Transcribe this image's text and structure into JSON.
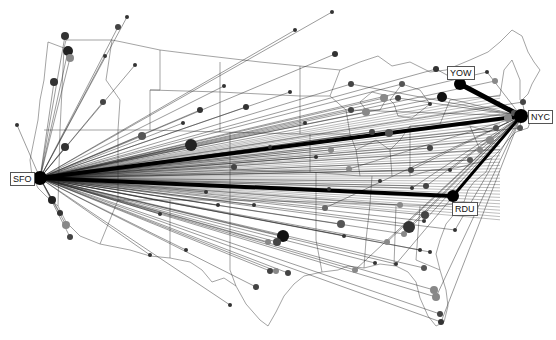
{
  "hubs": [
    {
      "code": "SFO",
      "x": 40,
      "y": 178,
      "label_x": 10,
      "label_y": 177
    },
    {
      "code": "NYC",
      "x": 521,
      "y": 116,
      "label_x": 529,
      "label_y": 111
    },
    {
      "code": "YOW",
      "x": 460,
      "y": 84,
      "label_x": 447,
      "label_y": 66
    },
    {
      "code": "RDU",
      "x": 453,
      "y": 196,
      "label_x": 453,
      "label_y": 202
    }
  ],
  "heavy_routes": [
    {
      "from": "SFO",
      "to": "NYC",
      "width": 4
    },
    {
      "from": "SFO",
      "to": "RDU",
      "width": 4
    },
    {
      "from": "YOW",
      "to": "NYC",
      "width": 5
    },
    {
      "from": "RDU",
      "to": "NYC",
      "width": 3
    }
  ],
  "colors": {
    "route": "#222222",
    "border": "#555555",
    "node_dark": "#111111",
    "node_mid": "#555555",
    "node_light": "#888888"
  },
  "nodes": [
    [
      127,
      17,
      2,
      "#333"
    ],
    [
      118,
      27,
      3,
      "#444"
    ],
    [
      65,
      36,
      4,
      "#333"
    ],
    [
      68,
      51,
      5,
      "#222"
    ],
    [
      70,
      58,
      4,
      "#888"
    ],
    [
      105,
      56,
      2,
      "#333"
    ],
    [
      135,
      65,
      2,
      "#333"
    ],
    [
      54,
      82,
      4,
      "#333"
    ],
    [
      17,
      125,
      2,
      "#333"
    ],
    [
      103,
      102,
      3,
      "#444"
    ],
    [
      142,
      136,
      4,
      "#555"
    ],
    [
      191,
      145,
      6,
      "#222"
    ],
    [
      65,
      147,
      4,
      "#333"
    ],
    [
      60,
      213,
      3,
      "#333"
    ],
    [
      66,
      225,
      4,
      "#888"
    ],
    [
      70,
      237,
      3,
      "#444"
    ],
    [
      52,
      200,
      4,
      "#222"
    ],
    [
      283,
      236,
      6,
      "#111"
    ],
    [
      277,
      242,
      4,
      "#444"
    ],
    [
      268,
      242,
      3,
      "#888"
    ],
    [
      270,
      271,
      3,
      "#444"
    ],
    [
      276,
      271,
      3,
      "#888"
    ],
    [
      288,
      273,
      3,
      "#444"
    ],
    [
      256,
      287,
      3,
      "#444"
    ],
    [
      325,
      208,
      3,
      "#666"
    ],
    [
      344,
      236,
      2,
      "#333"
    ],
    [
      387,
      242,
      3,
      "#888"
    ],
    [
      375,
      263,
      2,
      "#333"
    ],
    [
      355,
      270,
      3,
      "#888"
    ],
    [
      424,
      268,
      3,
      "#555"
    ],
    [
      396,
      264,
      2,
      "#333"
    ],
    [
      341,
      224,
      4,
      "#555"
    ],
    [
      409,
      227,
      6,
      "#333"
    ],
    [
      425,
      215,
      4,
      "#444"
    ],
    [
      424,
      221,
      2,
      "#333"
    ],
    [
      430,
      252,
      2,
      "#333"
    ],
    [
      455,
      230,
      2,
      "#333"
    ],
    [
      434,
      290,
      4,
      "#888"
    ],
    [
      436,
      297,
      4,
      "#888"
    ],
    [
      440,
      314,
      3,
      "#444"
    ],
    [
      441,
      322,
      3,
      "#333"
    ],
    [
      366,
      112,
      4,
      "#888"
    ],
    [
      351,
      110,
      3,
      "#444"
    ],
    [
      384,
      98,
      4,
      "#888"
    ],
    [
      398,
      98,
      3,
      "#444"
    ],
    [
      430,
      104,
      2,
      "#333"
    ],
    [
      442,
      97,
      5,
      "#111"
    ],
    [
      372,
      132,
      3,
      "#444"
    ],
    [
      389,
      133,
      4,
      "#555"
    ],
    [
      331,
      150,
      3,
      "#888"
    ],
    [
      246,
      107,
      3,
      "#333"
    ],
    [
      305,
      123,
      2,
      "#333"
    ],
    [
      426,
      186,
      3,
      "#444"
    ],
    [
      430,
      148,
      3,
      "#444"
    ],
    [
      450,
      170,
      2,
      "#333"
    ],
    [
      470,
      160,
      3,
      "#555"
    ],
    [
      480,
      150,
      3,
      "#888"
    ],
    [
      490,
      140,
      4,
      "#888"
    ],
    [
      496,
      128,
      3,
      "#555"
    ],
    [
      508,
      118,
      4,
      "#888"
    ],
    [
      514,
      113,
      3,
      "#555"
    ],
    [
      332,
      12,
      2,
      "#333"
    ],
    [
      295,
      30,
      2,
      "#333"
    ],
    [
      290,
      92,
      2,
      "#333"
    ],
    [
      224,
      86,
      2,
      "#333"
    ],
    [
      200,
      110,
      3,
      "#333"
    ],
    [
      183,
      123,
      2,
      "#333"
    ],
    [
      335,
      54,
      3,
      "#333"
    ],
    [
      351,
      84,
      3,
      "#444"
    ],
    [
      402,
      84,
      3,
      "#555"
    ],
    [
      436,
      69,
      3,
      "#333"
    ],
    [
      495,
      81,
      3,
      "#888"
    ],
    [
      487,
      72,
      2,
      "#333"
    ],
    [
      523,
      102,
      3,
      "#444"
    ],
    [
      520,
      128,
      3,
      "#555"
    ],
    [
      234,
      167,
      3,
      "#444"
    ],
    [
      270,
      147,
      2,
      "#333"
    ],
    [
      316,
      157,
      2,
      "#333"
    ],
    [
      218,
      205,
      2,
      "#333"
    ],
    [
      329,
      189,
      2,
      "#333"
    ],
    [
      349,
      169,
      3,
      "#888"
    ],
    [
      380,
      181,
      2,
      "#333"
    ],
    [
      411,
      170,
      3,
      "#444"
    ],
    [
      400,
      205,
      3,
      "#888"
    ],
    [
      412,
      188,
      2,
      "#333"
    ],
    [
      420,
      250,
      2,
      "#333"
    ],
    [
      404,
      234,
      3,
      "#888"
    ],
    [
      150,
      255,
      2,
      "#333"
    ],
    [
      186,
      250,
      2,
      "#333"
    ],
    [
      230,
      305,
      2,
      "#333"
    ],
    [
      160,
      214,
      2,
      "#333"
    ],
    [
      206,
      192,
      2,
      "#333"
    ],
    [
      254,
      205,
      2,
      "#333"
    ]
  ]
}
